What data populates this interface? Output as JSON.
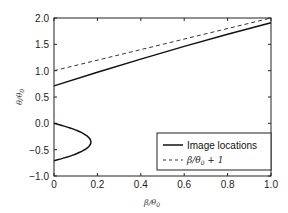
{
  "chart_data": {
    "type": "line",
    "title": "",
    "xlabel": "β/θ0",
    "ylabel": "θ/θ0",
    "xlim": [
      0,
      1.0
    ],
    "ylim": [
      -1.0,
      2.0
    ],
    "xticks": [
      "0",
      "0.2",
      "0.4",
      "0.6",
      "0.8",
      "1.0"
    ],
    "yticks": [
      "−1.0",
      "−0.5",
      "0.0",
      "0.5",
      "1.0",
      "1.5",
      "2.0"
    ],
    "grid": false,
    "legend_position": "lower right",
    "series": [
      {
        "name": "Image locations",
        "style": "solid",
        "branch": "upper",
        "x": [
          0,
          0.2,
          0.4,
          0.6,
          0.8,
          1.0
        ],
        "y": [
          0.71,
          0.97,
          1.22,
          1.46,
          1.69,
          1.91
        ]
      },
      {
        "name": "Image locations",
        "style": "solid",
        "branch": "lower",
        "x": [
          0,
          0.08,
          0.13,
          0.16,
          0.17,
          0.16,
          0.13,
          0.08,
          0
        ],
        "y": [
          0.0,
          -0.04,
          -0.12,
          -0.22,
          -0.35,
          -0.48,
          -0.58,
          -0.66,
          -0.71
        ]
      },
      {
        "name": "β/θ0 + 1",
        "style": "dashed",
        "x": [
          0,
          1.0
        ],
        "y": [
          1.0,
          2.0
        ]
      }
    ]
  },
  "labels": {
    "xlabel_main": "β/θ",
    "xlabel_sub": "0",
    "ylabel_main": "θ/θ",
    "ylabel_sub": "0",
    "legend_solid": "Image locations",
    "legend_dashed_main": "β/θ",
    "legend_dashed_sub": "0",
    "legend_dashed_tail": " + 1"
  }
}
